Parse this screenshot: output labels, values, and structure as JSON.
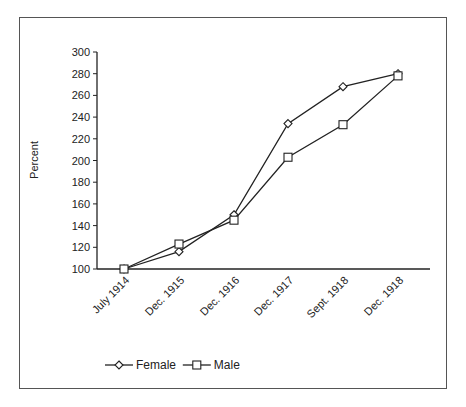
{
  "chart_data": {
    "type": "line",
    "title": "",
    "xlabel": "",
    "ylabel": "Percent",
    "ylim": [
      100,
      300
    ],
    "yticks": [
      100,
      120,
      140,
      160,
      180,
      200,
      220,
      240,
      260,
      280,
      300
    ],
    "grid": false,
    "legend_position": "bottom",
    "categories": [
      "July 1914",
      "Dec. 1915",
      "Dec. 1916",
      "Dec. 1917",
      "Sept. 1918",
      "Dec. 1918"
    ],
    "series": [
      {
        "name": "Female",
        "marker": "diamond",
        "values": [
          100,
          116,
          150,
          234,
          268,
          280
        ]
      },
      {
        "name": "Male",
        "marker": "square",
        "values": [
          100,
          123,
          145,
          203,
          233,
          278
        ]
      }
    ]
  }
}
